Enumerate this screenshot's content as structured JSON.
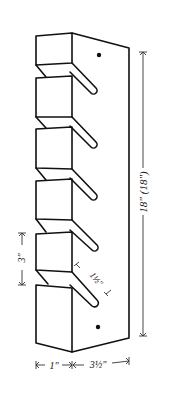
{
  "diagram": {
    "colors": {
      "stroke": "#111111",
      "background": "#ffffff",
      "dimension_line": "#333333"
    },
    "dimensions": {
      "height": {
        "label": "18\"  (18\")"
      },
      "slot_spacing": {
        "label": "3\""
      },
      "slot_length": {
        "label": "1½\""
      },
      "front_thickness": {
        "label": "1\""
      },
      "depth": {
        "label": "3½\""
      }
    },
    "blocks": {
      "count": 6
    },
    "slots": {
      "count": 5
    },
    "screw_holes": {
      "count": 2
    }
  }
}
